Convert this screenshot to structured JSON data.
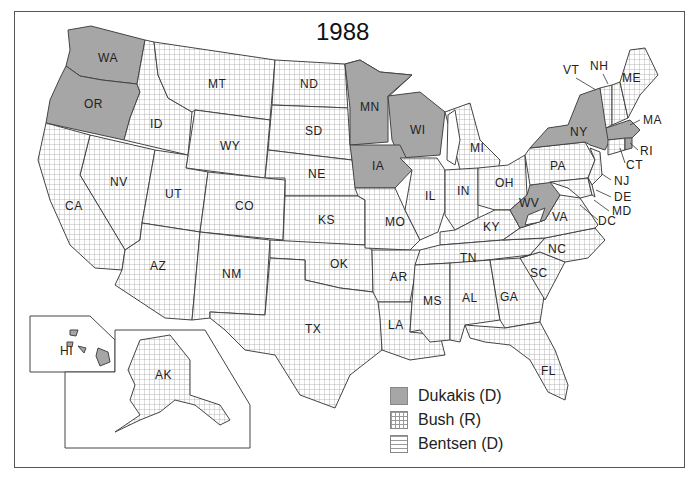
{
  "title": "1988",
  "legend": [
    {
      "label": "Dukakis (D)",
      "pattern": "solid",
      "color": "#a6a6a6"
    },
    {
      "label": "Bush (R)",
      "pattern": "grid",
      "color": "#ffffff"
    },
    {
      "label": "Bentsen (D)",
      "pattern": "horizontal-lines",
      "color": "#ffffff"
    }
  ],
  "colors": {
    "dukakis": "#a6a6a6",
    "grid_line": "#9a9a9a",
    "border": "#444444"
  },
  "states": {
    "dukakis": [
      "WA",
      "OR",
      "MN",
      "WI",
      "IA",
      "NY",
      "MA",
      "RI",
      "WV",
      "HI",
      "DC"
    ],
    "bush": [
      "MT",
      "ID",
      "ND",
      "SD",
      "WY",
      "NE",
      "NV",
      "UT",
      "CO",
      "CA",
      "KS",
      "AZ",
      "NM",
      "OK",
      "TX",
      "MO",
      "AR",
      "LA",
      "IL",
      "IN",
      "MI",
      "OH",
      "KY",
      "TN",
      "MS",
      "AL",
      "GA",
      "FL",
      "SC",
      "NC",
      "VA",
      "PA",
      "NJ",
      "DE",
      "MD",
      "CT",
      "VT",
      "NH",
      "ME",
      "AK"
    ],
    "bentsen": [
      "WV (one elector)"
    ]
  },
  "labels": {
    "WA": "WA",
    "OR": "OR",
    "ID": "ID",
    "MT": "MT",
    "ND": "ND",
    "SD": "SD",
    "WY": "WY",
    "NE": "NE",
    "NV": "NV",
    "UT": "UT",
    "CO": "CO",
    "CA": "CA",
    "KS": "KS",
    "AZ": "AZ",
    "NM": "NM",
    "OK": "OK",
    "TX": "TX",
    "MN": "MN",
    "IA": "IA",
    "MO": "MO",
    "AR": "AR",
    "LA": "LA",
    "WI": "WI",
    "IL": "IL",
    "MI": "MI",
    "IN": "IN",
    "OH": "OH",
    "KY": "KY",
    "TN": "TN",
    "MS": "MS",
    "AL": "AL",
    "GA": "GA",
    "FL": "FL",
    "SC": "SC",
    "NC": "NC",
    "VA": "VA",
    "WV": "WV",
    "PA": "PA",
    "NY": "NY",
    "VT": "VT",
    "NH": "NH",
    "ME": "ME",
    "MA": "MA",
    "RI": "RI",
    "CT": "CT",
    "NJ": "NJ",
    "DE": "DE",
    "MD": "MD",
    "DC": "DC",
    "HI": "HI",
    "AK": "AK"
  }
}
